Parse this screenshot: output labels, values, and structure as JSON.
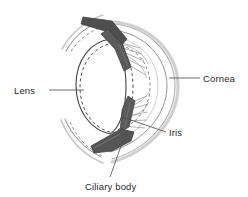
{
  "figure": {
    "background_color": "#ffffff",
    "width": 248,
    "height": 197
  },
  "labels": [
    {
      "id": "lens",
      "text": "Lens",
      "x": 14,
      "y": 94,
      "anchor": "start",
      "leader": "M 49 90 L 84 90"
    },
    {
      "id": "cornea",
      "text": "Cornea",
      "x": 203,
      "y": 82,
      "anchor": "start",
      "leader": "M 169 78 L 200 78"
    },
    {
      "id": "iris",
      "text": "Iris",
      "x": 169,
      "y": 136,
      "anchor": "start",
      "leader": "M 122 117 L 166 132"
    },
    {
      "id": "ciliary-body",
      "text": "Ciliary body",
      "x": 85,
      "y": 190,
      "anchor": "start",
      "leader": "M 126 132 L 110 177"
    }
  ],
  "colors": {
    "outline": "#4a4a4a",
    "iris_fill": "#585858",
    "iris_fill_light": "#6e6e6e",
    "cornea_stroke": "#b8b8b8",
    "sclera_stroke": "#9a9a9a",
    "lens_stroke": "#555555",
    "lens_dashed_stroke": "#555555",
    "zonule_stroke": "#7a7a7a",
    "text": "#2b2b2b",
    "leader": "#4a4a4a"
  },
  "structures": [
    {
      "id": "cornea-outer-arc",
      "name": "cornea-outer-arc",
      "description": "Outer light-gray corneal curve on the right side",
      "stroke": "#c4c4c4",
      "stroke_width": 2.2,
      "path": "M 113 23 C 150 25, 176 55, 176 86 C 176 118, 150 150, 112 160"
    },
    {
      "id": "cornea-inner-arc",
      "name": "cornea-inner-arc",
      "description": "Inner corneal curve",
      "stroke": "#9e9e9e",
      "stroke_width": 1.0,
      "path": "M 112 28 C 146 31, 169 58, 169 86 C 169 114, 146 143, 110 153"
    },
    {
      "id": "cornea-limbus-arc",
      "name": "cornea-limbus-arc",
      "description": "Faint third corneal / anterior chamber curve",
      "stroke": "#bfbfbf",
      "stroke_width": 0.8,
      "path": "M 115 35 C 143 39, 161 60, 161 86 C 161 112, 143 133, 114 145"
    },
    {
      "id": "sclera-upper",
      "name": "sclera-upper-curve",
      "description": "Upper scleral wall curving to the left",
      "stroke": "#8f8f8f",
      "stroke_width": 1.0,
      "path": "M 100 19 C 86 25, 74 36, 66 50"
    },
    {
      "id": "sclera-lower",
      "name": "sclera-lower-curve",
      "description": "Lower scleral wall curving to the left",
      "stroke": "#8f8f8f",
      "stroke_width": 1.0,
      "path": "M 64 120 C 72 136, 84 149, 100 157"
    },
    {
      "id": "lens-solid",
      "name": "lens-relaxed-outline",
      "description": "Solid outline of the lens (relaxed / flattened state)",
      "stroke": "#4a4a4a",
      "stroke_width": 1.1,
      "dash": "none",
      "path": "M 110 38 C 92 41, 76 58, 76 85 C 76 112, 92 131, 111 135 C 120 129, 126 110, 126 86 C 126 62, 120 44, 110 38 Z"
    },
    {
      "id": "lens-dashed",
      "name": "lens-accommodated-outline",
      "description": "Dashed outline of the lens (accommodated / rounded state)",
      "stroke": "#4a4a4a",
      "stroke_width": 1.0,
      "dash": "3.2,2.6",
      "path": "M 114 42 C 95 44, 80 62, 80 87 C 80 113, 95 130, 114 133 C 126 126, 133 108, 133 87 C 133 64, 126 48, 114 42 Z"
    },
    {
      "id": "iris-upper",
      "name": "iris-upper-leaf",
      "description": "Upper dark iris leaf pointing toward the pupil",
      "fill": "#575757",
      "stroke": "#3c3c3c",
      "path": "M 106 27 L 122 44 L 130 66 L 124 70 L 114 48 L 100 33 Z"
    },
    {
      "id": "ciliary-upper",
      "name": "ciliary-body-upper",
      "description": "Upper ciliary body wedge attached to the sclera",
      "fill": "#4f4f4f",
      "stroke": "#3c3c3c",
      "path": "M 84 18 L 112 22 L 126 38 L 120 44 L 104 31 L 82 24 Z"
    },
    {
      "id": "iris-lower",
      "name": "iris-lower-leaf",
      "description": "Lower dark iris leaf pointing toward the pupil",
      "fill": "#575757",
      "stroke": "#3c3c3c",
      "path": "M 129 98 L 134 102 L 128 126 L 120 131 L 122 110 Z"
    },
    {
      "id": "ciliary-lower",
      "name": "ciliary-body-lower",
      "description": "Lower ciliary body wedge attached to the sclera",
      "fill": "#555555",
      "stroke": "#3c3c3c",
      "path": "M 92 145 L 122 130 L 133 133 L 130 141 L 112 150 L 95 152 Z"
    },
    {
      "id": "zonules-upper",
      "name": "zonule-fibers-upper",
      "description": "Suspensory zonule fibers radiating from upper ciliary body",
      "stroke": "#7d7d7d"
    },
    {
      "id": "zonules-lower",
      "name": "zonule-fibers-lower",
      "description": "Suspensory zonule fibers radiating from lower ciliary body",
      "stroke": "#7d7d7d"
    },
    {
      "id": "anterior-chamber-dashed",
      "name": "anterior-chamber-dashed-outline",
      "description": "Dashed outline marking the anterior chamber boundary",
      "stroke": "#6a6a6a",
      "dash": "3,2.5"
    }
  ]
}
